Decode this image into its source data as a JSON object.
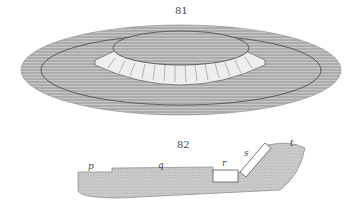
{
  "figures": [
    {
      "number": "81",
      "description": "Perspective view of a circular crater-like mound with a terraced rim on a flat plain"
    },
    {
      "number": "82",
      "description": "Cross-section profile of a sloped terrain with labeled features",
      "labels": {
        "p": "p",
        "q": "q",
        "r": "r",
        "s": "s",
        "t": "t"
      }
    }
  ],
  "colors": {
    "ink": "#555555",
    "hatch": "#8a8a8a",
    "paper": "#ffffff"
  }
}
